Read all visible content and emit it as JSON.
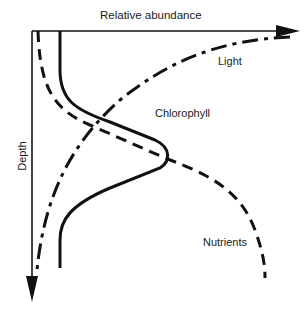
{
  "figure": {
    "x_axis_label": "Relative abundance",
    "y_axis_label": "Depth",
    "curves": [
      {
        "name": "Light",
        "style": "dash-dot",
        "description": "decreases with depth, highest at surface"
      },
      {
        "name": "Chlorophyll",
        "style": "solid",
        "description": "subsurface maximum at intermediate depth"
      },
      {
        "name": "Nutrients",
        "style": "dashed",
        "description": "low at surface, increases with depth"
      }
    ],
    "labels": {
      "light": "Light",
      "chlorophyll": "Chlorophyll",
      "nutrients": "Nutrients"
    },
    "colors": {
      "ink": "#111111",
      "background": "#ffffff"
    }
  }
}
